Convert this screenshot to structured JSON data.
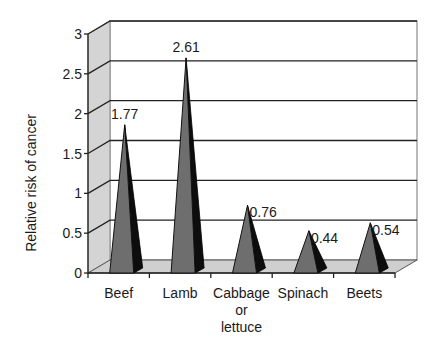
{
  "chart_data": {
    "type": "bar",
    "style": "3d-pyramid",
    "title": "",
    "xlabel": "",
    "ylabel": "Relative risk of cancer",
    "categories": [
      [
        "Beef"
      ],
      [
        "Lamb"
      ],
      [
        "Cabbage",
        "or",
        "lettuce"
      ],
      [
        "Spinach"
      ],
      [
        "Beets"
      ]
    ],
    "values": [
      1.77,
      2.61,
      0.76,
      0.44,
      0.54
    ],
    "data_labels": [
      "1.77",
      "2.61",
      "0.76",
      "0.44",
      "0.54"
    ],
    "ylim": [
      0,
      3
    ],
    "yticks": [
      0,
      0.5,
      1,
      1.5,
      2,
      2.5,
      3
    ],
    "ytick_labels": [
      "0",
      "0.5",
      "1",
      "1.5",
      "2",
      "2.5",
      "3"
    ],
    "grid": true,
    "legend": "none"
  },
  "colors": {
    "pyramid_front": "#6e6e6e",
    "pyramid_side": "#0d0d0d",
    "side_wall": "#d4d4d4",
    "floor": "#cfcfcf",
    "gridline": "#222222",
    "wall_border": "#8c8c8c"
  }
}
